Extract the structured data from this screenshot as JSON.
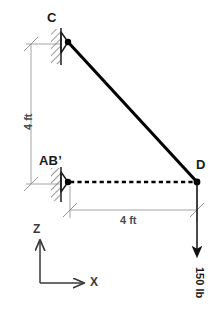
{
  "figure": {
    "type": "engineering-diagram",
    "background_color": "#ffffff",
    "member_color": "#000000",
    "dimension_color": "#8c8c8c",
    "hatch_color": "#6e6e6e"
  },
  "labels": {
    "point_c": "C",
    "point_ab": "AB’",
    "point_d": "D",
    "dim_vertical": "4 ft",
    "dim_horizontal": "4 ft",
    "force": "150 lb",
    "axis_z": "Z",
    "axis_x": "X"
  },
  "geometry": {
    "c_x": 68,
    "c_y": 42,
    "ab_x": 68,
    "ab_y": 182,
    "d_x": 197,
    "d_y": 182,
    "vertical_span_ft": 4,
    "horizontal_span_ft": 4
  },
  "members": [
    {
      "name": "CD",
      "from": "C",
      "to": "D",
      "style": "solid",
      "role": "two-force-member"
    },
    {
      "name": "AB-D",
      "from": "AB’",
      "to": "D",
      "style": "dashed",
      "role": "axis-of-rod"
    }
  ],
  "supports": [
    {
      "name": "support-c",
      "at": "C",
      "type": "pin-on-wall"
    },
    {
      "name": "support-ab",
      "at": "AB’",
      "type": "pin-on-wall"
    }
  ],
  "loads": [
    {
      "name": "load-d",
      "at": "D",
      "magnitude": 150,
      "unit": "lb",
      "direction": "downward",
      "label": "150 lb"
    }
  ],
  "dimensions": [
    {
      "name": "dim-vertical",
      "value": 4,
      "unit": "ft",
      "label": "4 ft",
      "orientation": "vertical"
    },
    {
      "name": "dim-horizontal",
      "value": 4,
      "unit": "ft",
      "label": "4 ft",
      "orientation": "horizontal"
    }
  ],
  "axes": {
    "origin_label": "",
    "vertical_axis": "Z",
    "horizontal_axis": "X"
  }
}
